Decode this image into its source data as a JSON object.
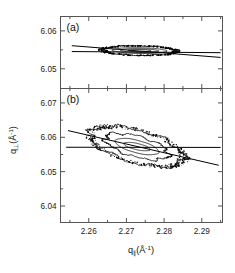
{
  "figure": {
    "background": "#ffffff",
    "line_color": "#000000",
    "axis_color": "#555555"
  },
  "axes": {
    "xlabel_q": "q",
    "xlabel_sub": "∥",
    "xlabel_unit_open": "(Å",
    "xlabel_sup": "-1",
    "xlabel_unit_close": ")",
    "ylabel_q": "q",
    "ylabel_sub": "⊥",
    "ylabel_unit_open": "(Å",
    "ylabel_sup": "-1",
    "ylabel_unit_close": ")",
    "x_ticks": [
      "2.26",
      "2.27",
      "2.28",
      "2.29"
    ],
    "x_tick_values": [
      2.26,
      2.27,
      2.28,
      2.29
    ],
    "x_minor_count": 1,
    "xlim": [
      2.2525,
      2.2955
    ]
  },
  "panels": [
    {
      "id": "a",
      "label": "(a)",
      "y_ticks": [
        "6.05",
        "6.06"
      ],
      "y_tick_values": [
        6.05,
        6.06
      ],
      "ylim": [
        6.0448,
        6.0638
      ]
    },
    {
      "id": "b",
      "label": "(b)",
      "y_ticks": [
        "6.04",
        "6.05",
        "6.06",
        "6.07"
      ],
      "y_tick_values": [
        6.04,
        6.05,
        6.06,
        6.07
      ],
      "ylim": [
        6.0352,
        6.0742
      ]
    }
  ],
  "chart_data": {
    "type": "contour",
    "title": "",
    "xlabel": "q∥(Å-1)",
    "ylabel": "q⊥(Å-1)",
    "grid": false,
    "legend": "none",
    "panels": [
      {
        "id": "a",
        "label": "(a)",
        "xlim": [
          2.2525,
          2.2955
        ],
        "ylim": [
          6.0448,
          6.0638
        ],
        "description": "Narrow horizontally elongated lens-shaped reciprocal-space map centred near q_par 2.2735, q_perp 6.0548; four nested contour levels, outermost noisy/speckled.",
        "center": [
          2.2735,
          6.0548
        ],
        "contours": [
          {
            "level": 1,
            "semi_x": 0.0098,
            "semi_y": 0.00125,
            "tilt_deg": -1.0,
            "noisy": true
          },
          {
            "level": 2,
            "semi_x": 0.0072,
            "semi_y": 0.00075,
            "tilt_deg": -1.0,
            "noisy": false
          },
          {
            "level": 3,
            "semi_x": 0.005,
            "semi_y": 0.00048,
            "tilt_deg": -1.0,
            "noisy": false
          },
          {
            "level": 4,
            "semi_x": 0.003,
            "semi_y": 0.00028,
            "tilt_deg": -1.0,
            "noisy": false
          }
        ],
        "lines": [
          {
            "name": "horizontal-streak",
            "x1": 2.2555,
            "y1": 6.05455,
            "x2": 2.295,
            "y2": 6.05425
          },
          {
            "name": "tilted-streak",
            "x1": 2.2555,
            "y1": 6.0561,
            "x2": 2.295,
            "y2": 6.053
          }
        ]
      },
      {
        "id": "b",
        "label": "(b)",
        "xlim": [
          2.2525,
          2.2955
        ],
        "ylim": [
          6.0352,
          6.0742
        ],
        "description": "Tilted elliptical reciprocal-space map centred near q_par 2.2728, q_perp 6.0573; four nested contour levels inclined about -17 degrees, outermost noisy/speckled.",
        "center": [
          2.2728,
          6.0573
        ],
        "contours": [
          {
            "level": 1,
            "semi_x": 0.0128,
            "semi_y": 0.0047,
            "tilt_deg": -17.0,
            "noisy": true
          },
          {
            "level": 2,
            "semi_x": 0.0088,
            "semi_y": 0.003,
            "tilt_deg": -17.0,
            "noisy": true
          },
          {
            "level": 3,
            "semi_x": 0.006,
            "semi_y": 0.0018,
            "tilt_deg": -16.0,
            "noisy": false
          },
          {
            "level": 4,
            "semi_x": 0.0036,
            "semi_y": 0.0009,
            "tilt_deg": -14.0,
            "noisy": false
          }
        ],
        "lines": [
          {
            "name": "horizontal-streak",
            "x1": 2.254,
            "y1": 6.0571,
            "x2": 2.295,
            "y2": 6.05705
          },
          {
            "name": "tilted-streak",
            "x1": 2.2545,
            "y1": 6.06195,
            "x2": 2.2945,
            "y2": 6.05185
          }
        ]
      }
    ]
  }
}
